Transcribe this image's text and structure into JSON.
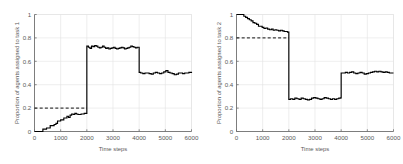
{
  "figure": {
    "background_color": "#ffffff",
    "line_color": "#000000",
    "grid_color": "#e2e2e2",
    "axis_color": "#6e6e6e",
    "text_color": "#5a5a5a"
  },
  "chart_data": [
    {
      "type": "line",
      "title": "",
      "xlabel": "Time steps",
      "ylabel": "Proportion of agents assigned to task 1",
      "xlim": [
        0,
        6000
      ],
      "ylim": [
        0,
        1
      ],
      "xticks": [
        0,
        1000,
        2000,
        3000,
        4000,
        5000,
        6000
      ],
      "xticklabels": [
        "0",
        "1000",
        "2000",
        "3000",
        "4000",
        "5000",
        "6000"
      ],
      "yticks": [
        0,
        0.2,
        0.4,
        0.6,
        0.8,
        1
      ],
      "yticklabels": [
        "0",
        "0.2",
        "0.4",
        "0.6",
        "0.8",
        "1"
      ],
      "grid": true,
      "legend": "none",
      "annotations": [
        {
          "kind": "reference-line",
          "style": "dashed",
          "orientation": "horizontal",
          "y": 0.2,
          "x_start": 0,
          "x_end": 2000,
          "label": "target proportion 0.2"
        }
      ],
      "series": [
        {
          "name": "proportion assigned to task 1",
          "drawstyle": "steps-post",
          "x": [
            0,
            250,
            320,
            390,
            460,
            530,
            600,
            680,
            750,
            820,
            880,
            940,
            1000,
            1060,
            1120,
            1180,
            1240,
            1300,
            1360,
            1420,
            1480,
            1540,
            1600,
            1660,
            1720,
            1780,
            1840,
            1900,
            1960,
            2000,
            2000,
            2060,
            2120,
            2180,
            2240,
            2300,
            2360,
            2420,
            2480,
            2540,
            2600,
            2660,
            2720,
            2780,
            2840,
            2900,
            2960,
            3020,
            3080,
            3140,
            3200,
            3260,
            3320,
            3380,
            3440,
            3500,
            3560,
            3620,
            3680,
            3740,
            3800,
            3860,
            3920,
            3980,
            4000,
            4000,
            4060,
            4140,
            4220,
            4300,
            4380,
            4460,
            4540,
            4620,
            4700,
            4780,
            4860,
            4940,
            5020,
            5100,
            5180,
            5260,
            5340,
            5420,
            5500,
            5580,
            5660,
            5740,
            5820,
            5900,
            6000
          ],
          "y": [
            0.0,
            0.0,
            0.02,
            0.02,
            0.03,
            0.03,
            0.05,
            0.05,
            0.06,
            0.07,
            0.09,
            0.09,
            0.1,
            0.1,
            0.115,
            0.115,
            0.13,
            0.12,
            0.14,
            0.15,
            0.145,
            0.155,
            0.15,
            0.145,
            0.145,
            0.15,
            0.15,
            0.155,
            0.155,
            0.17,
            0.73,
            0.72,
            0.71,
            0.73,
            0.725,
            0.735,
            0.73,
            0.72,
            0.715,
            0.72,
            0.73,
            0.72,
            0.71,
            0.715,
            0.705,
            0.71,
            0.715,
            0.72,
            0.71,
            0.705,
            0.71,
            0.715,
            0.72,
            0.715,
            0.705,
            0.71,
            0.715,
            0.72,
            0.73,
            0.725,
            0.72,
            0.715,
            0.72,
            0.72,
            0.72,
            0.505,
            0.5,
            0.495,
            0.5,
            0.5,
            0.495,
            0.49,
            0.5,
            0.505,
            0.5,
            0.495,
            0.5,
            0.51,
            0.52,
            0.505,
            0.5,
            0.495,
            0.485,
            0.49,
            0.5,
            0.5,
            0.495,
            0.5,
            0.5,
            0.505,
            0.5
          ]
        }
      ]
    },
    {
      "type": "line",
      "title": "",
      "xlabel": "Time steps",
      "ylabel": "Proportion of agents assigned to task 2",
      "xlim": [
        0,
        6000
      ],
      "ylim": [
        0,
        1
      ],
      "xticks": [
        0,
        1000,
        2000,
        3000,
        4000,
        5000,
        6000
      ],
      "xticklabels": [
        "0",
        "1000",
        "2000",
        "3000",
        "4000",
        "5000",
        "6000"
      ],
      "yticks": [
        0,
        0.2,
        0.4,
        0.6,
        0.8,
        1
      ],
      "yticklabels": [
        "0",
        "0.2",
        "0.4",
        "0.6",
        "0.8",
        "1"
      ],
      "grid": true,
      "legend": "none",
      "annotations": [
        {
          "kind": "reference-line",
          "style": "dashed",
          "orientation": "horizontal",
          "y": 0.8,
          "x_start": 0,
          "x_end": 2000,
          "label": "target proportion 0.8"
        }
      ],
      "series": [
        {
          "name": "proportion assigned to task 2",
          "drawstyle": "steps-post",
          "x": [
            0,
            200,
            280,
            350,
            420,
            490,
            560,
            630,
            700,
            770,
            840,
            910,
            980,
            1050,
            1120,
            1190,
            1260,
            1330,
            1400,
            1470,
            1540,
            1610,
            1680,
            1750,
            1820,
            1890,
            1950,
            2000,
            2000,
            2070,
            2150,
            2230,
            2310,
            2390,
            2470,
            2550,
            2630,
            2710,
            2790,
            2870,
            2950,
            3030,
            3110,
            3190,
            3270,
            3350,
            3430,
            3510,
            3590,
            3670,
            3750,
            3830,
            3910,
            3990,
            4000,
            4000,
            4080,
            4160,
            4240,
            4320,
            4400,
            4480,
            4560,
            4640,
            4720,
            4800,
            4880,
            4960,
            5040,
            5120,
            5200,
            5280,
            5360,
            5440,
            5520,
            5600,
            5680,
            5760,
            5840,
            5920,
            6000
          ],
          "y": [
            1.0,
            1.0,
            0.985,
            0.975,
            0.965,
            0.955,
            0.945,
            0.93,
            0.925,
            0.915,
            0.9,
            0.9,
            0.89,
            0.88,
            0.885,
            0.875,
            0.87,
            0.875,
            0.865,
            0.87,
            0.865,
            0.86,
            0.865,
            0.86,
            0.855,
            0.855,
            0.85,
            0.85,
            0.275,
            0.28,
            0.275,
            0.285,
            0.28,
            0.275,
            0.285,
            0.28,
            0.275,
            0.27,
            0.275,
            0.285,
            0.29,
            0.285,
            0.28,
            0.275,
            0.28,
            0.29,
            0.285,
            0.28,
            0.275,
            0.28,
            0.275,
            0.28,
            0.285,
            0.29,
            0.29,
            0.5,
            0.5,
            0.505,
            0.5,
            0.505,
            0.51,
            0.5,
            0.495,
            0.5,
            0.505,
            0.5,
            0.49,
            0.495,
            0.5,
            0.505,
            0.51,
            0.515,
            0.51,
            0.515,
            0.51,
            0.505,
            0.51,
            0.505,
            0.5,
            0.5,
            0.5
          ]
        }
      ]
    }
  ]
}
